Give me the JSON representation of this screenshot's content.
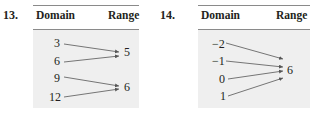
{
  "problems": [
    {
      "number": "13.",
      "domain_header": "Domain",
      "range_header": "Range",
      "domain": [
        "3",
        "6",
        "9",
        "12"
      ],
      "range": [
        "5",
        "6"
      ],
      "mapping": [
        [
          "3",
          "5"
        ],
        [
          "6",
          "5"
        ],
        [
          "9",
          "6"
        ],
        [
          "12",
          "6"
        ]
      ]
    },
    {
      "number": "14.",
      "domain_header": "Domain",
      "range_header": "Range",
      "domain": [
        "−2",
        "−1",
        "0",
        "1"
      ],
      "range": [
        "6"
      ],
      "mapping": [
        [
          "−2",
          "6"
        ],
        [
          "−1",
          "6"
        ],
        [
          "0",
          "6"
        ],
        [
          "1",
          "6"
        ]
      ]
    }
  ],
  "colors": {
    "box": "#efefef",
    "rule": "#8a8a8a",
    "arrow": "#555555",
    "text": "#231f20"
  }
}
